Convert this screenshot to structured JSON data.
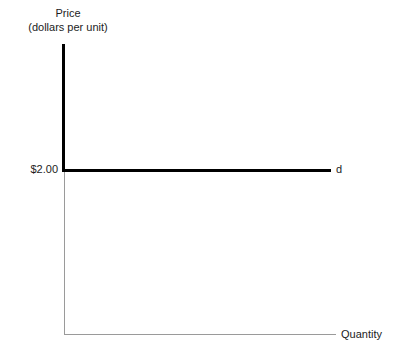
{
  "chart_data": {
    "type": "line",
    "title": "",
    "ylabel": "Price",
    "ylabel_sub": "(dollars per unit)",
    "xlabel": "Quantity",
    "grid": false,
    "legend": "none",
    "axis_style": "open L-shaped axes, no tick marks, no numeric scale on x-axis",
    "ytick_labels": [
      "$2.00"
    ],
    "ytick_values": [
      2.0
    ],
    "xtick_labels": [],
    "series": [
      {
        "name": "d",
        "label": "d",
        "description": "perfectly elastic (horizontal) demand curve at price $2.00",
        "color": "#000000",
        "price": 2.0,
        "points": [
          {
            "quantity": 0,
            "price": 2.0
          },
          {
            "quantity": 100,
            "price": 2.0
          }
        ]
      }
    ],
    "annotations": [
      {
        "text": "d",
        "position": "right end of horizontal demand line"
      },
      {
        "text": "$2.00",
        "position": "y-axis at price level of demand line"
      }
    ]
  },
  "chart": {
    "y_axis_title_line1": "Price",
    "y_axis_title_line2": "(dollars per unit)",
    "x_axis_title": "Quantity",
    "price_tick_label": "$2.00",
    "demand_curve_label": "d",
    "colors": {
      "curve": "#000000",
      "axis": "#9a9a9a",
      "text": "#1c1c1c",
      "background": "#ffffff"
    }
  }
}
